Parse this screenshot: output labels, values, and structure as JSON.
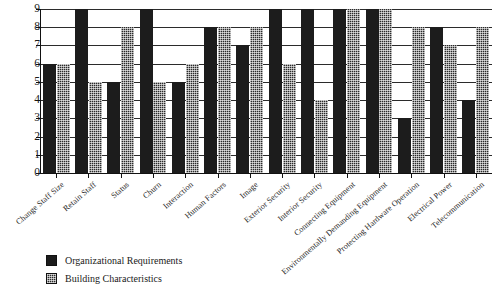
{
  "chart_data": {
    "type": "bar",
    "title": "",
    "xlabel": "",
    "ylabel": "",
    "ylim": [
      0,
      9
    ],
    "y_ticks": [
      0,
      1,
      2,
      3,
      4,
      5,
      6,
      7,
      8,
      9
    ],
    "grid": true,
    "legend_position": "bottom-left",
    "categories": [
      "Change Staff Size",
      "Retain Staff",
      "Status",
      "Churn",
      "Interaction",
      "Human Factors",
      "Image",
      "Exterior Security",
      "Interior Security",
      "Connecting Equipment",
      "Environmentally Demanding Equipment",
      "Protecting Hardware Operation",
      "Electrical Power",
      "Telecommunication"
    ],
    "series": [
      {
        "name": "Organizational Requirements",
        "pattern": "solid",
        "color": "#1c1c1c",
        "values": [
          6,
          9,
          5,
          9,
          5,
          8,
          7,
          9,
          9,
          9,
          9,
          3,
          8,
          4
        ]
      },
      {
        "name": "Building Characteristics",
        "pattern": "hatch",
        "color": "#2a2a2a",
        "values": [
          6,
          5,
          8,
          5,
          6,
          8,
          8,
          6,
          4,
          9,
          9,
          8,
          7,
          8
        ]
      }
    ]
  },
  "legend": {
    "items": [
      {
        "label": "Organizational Requirements",
        "pattern": "solid"
      },
      {
        "label": "Building Characteristics",
        "pattern": "hatch"
      }
    ]
  }
}
